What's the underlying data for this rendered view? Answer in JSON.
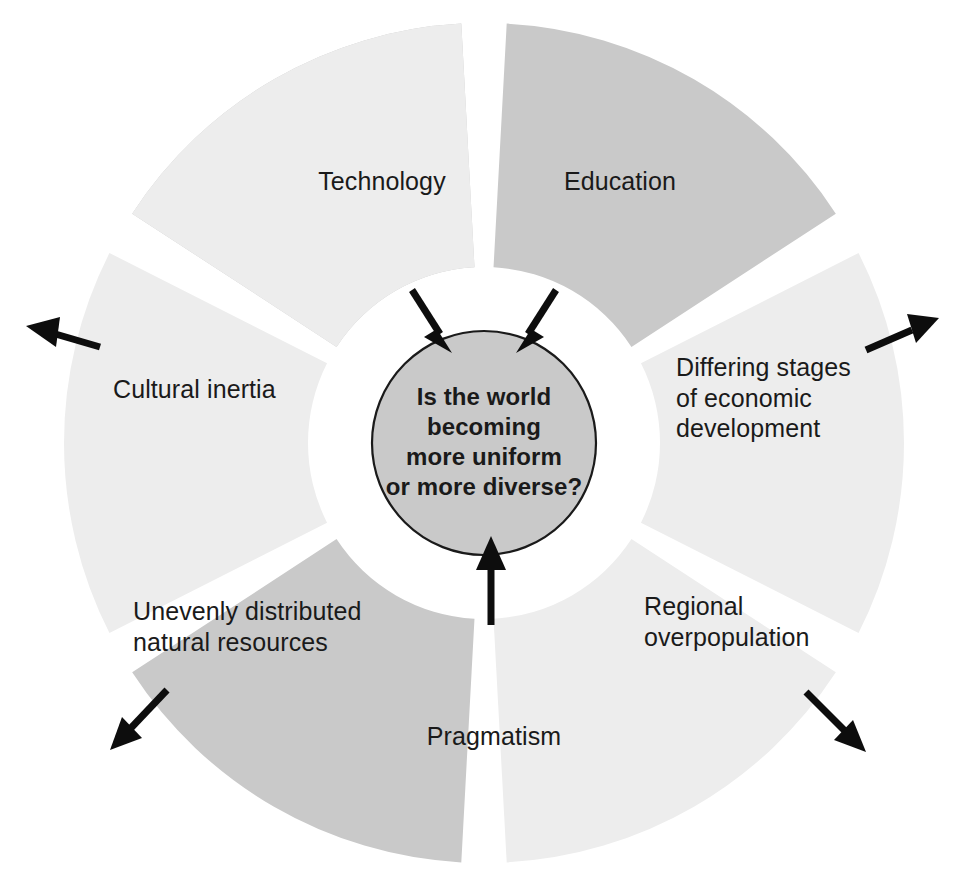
{
  "diagram": {
    "title_question": "Is the world becoming more uniform or more diverse?",
    "center": {
      "text": "Is the world\nbecoming\nmore uniform\nor more diverse?"
    },
    "colors": {
      "wedge_dark": "#c9c9c9",
      "wedge_light": "#ededed",
      "center_fill": "#c9c9c9",
      "arrow": "#0d0d0d",
      "text": "#1a1a1a",
      "background": "#ffffff"
    },
    "segments": [
      {
        "id": "technology",
        "label": "Technology",
        "tone": "dark",
        "arrow_direction": "inward",
        "position": "top-left"
      },
      {
        "id": "education",
        "label": "Education",
        "tone": "dark",
        "arrow_direction": "inward",
        "position": "top-right"
      },
      {
        "id": "differing-stages",
        "label": "Differing stages\nof economic\ndevelopment",
        "tone": "light",
        "arrow_direction": "outward",
        "position": "right"
      },
      {
        "id": "regional-overpopulation",
        "label": "Regional\noverpopulation",
        "tone": "light",
        "arrow_direction": "outward",
        "position": "bottom-right"
      },
      {
        "id": "pragmatism",
        "label": "Pragmatism",
        "tone": "dark",
        "arrow_direction": "inward",
        "position": "bottom"
      },
      {
        "id": "unevenly-distributed-resources",
        "label": "Unevenly distributed\nnatural resources",
        "tone": "light",
        "arrow_direction": "outward",
        "position": "bottom-left"
      },
      {
        "id": "cultural-inertia",
        "label": "Cultural inertia",
        "tone": "light",
        "arrow_direction": "outward",
        "position": "left"
      }
    ]
  }
}
